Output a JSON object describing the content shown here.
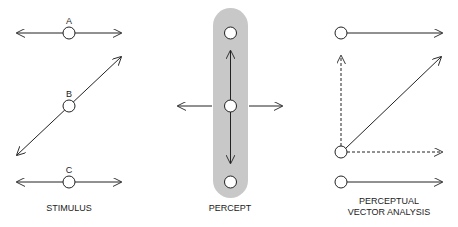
{
  "panels": {
    "stimulus": {
      "title": "STIMULUS",
      "labels": [
        "A",
        "B",
        "C"
      ]
    },
    "percept": {
      "title": "PERCEPT"
    },
    "analysis": {
      "title_line1": "PERCEPTUAL",
      "title_line2": "VECTOR ANALYSIS"
    }
  },
  "colors": {
    "stroke": "#222222",
    "pill": "#c8c8c8"
  }
}
